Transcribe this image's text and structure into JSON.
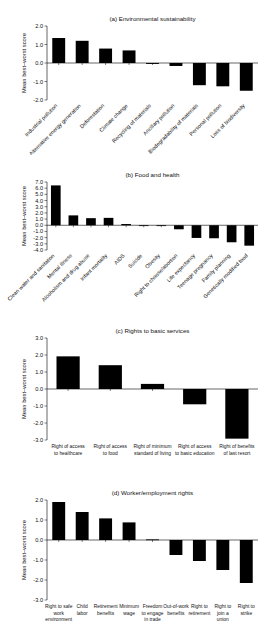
{
  "figure": {
    "ylabel": "Mean best–worst score",
    "panels": [
      {
        "title": "(a) Environmental sustainability",
        "label_style": "rotated",
        "chart": {
          "type": "bar",
          "title": "(a) Environmental sustainability",
          "xlabel": "",
          "ylabel": "Mean best–worst score",
          "ylim": [
            -2.0,
            2.0
          ],
          "yticks": [
            2.0,
            1.0,
            0.0,
            -1.0,
            -2.0
          ],
          "ytick_labels": [
            "2.0",
            "1.0",
            "0.0",
            "-1.0",
            "-2.0"
          ],
          "grid": false,
          "legend": "none",
          "categories": [
            "Industrial pollution",
            "Alternative energy generation",
            "Deforestation",
            "Climate change",
            "Recycling of materials",
            "Ancillary pollution",
            "Biodegradability of materials",
            "Personal pollution",
            "Loss of biodiversity"
          ],
          "values": [
            1.35,
            1.2,
            0.78,
            0.68,
            -0.05,
            -0.16,
            -1.2,
            -1.26,
            -1.5
          ]
        }
      },
      {
        "title": "(b) Food and health",
        "label_style": "rotated",
        "chart": {
          "type": "bar",
          "title": "(b) Food and health",
          "xlabel": "",
          "ylabel": "Mean best–worst score",
          "ylim": [
            -4.0,
            7.0
          ],
          "yticks": [
            7.0,
            6.0,
            5.0,
            4.0,
            3.0,
            2.0,
            1.0,
            0.0,
            -1.0,
            -2.0,
            -3.0,
            -4.0
          ],
          "ytick_labels": [
            "7.0",
            "6.0",
            "5.0",
            "4.0",
            "3.0",
            "2.0",
            "1.0",
            "0.0",
            "-1.0",
            "-2.0",
            "-3.0",
            "-4.0"
          ],
          "grid": false,
          "legend": "none",
          "categories": [
            "Clean water and sanitation",
            "Mental illness",
            "Alcoholism and drug abuse",
            "Infant mortality",
            "AIDS",
            "Suicide",
            "Obesity",
            "Right to choose/abortion",
            "Life expectancy",
            "Teenage pregnancy",
            "Family planning",
            "Genetically modified food"
          ],
          "values": [
            6.45,
            1.6,
            1.15,
            1.2,
            0.2,
            -0.02,
            -0.05,
            -0.65,
            -2.05,
            -2.1,
            -2.75,
            -3.3
          ]
        }
      },
      {
        "title": "(c) Rights to basic services",
        "label_style": "flat",
        "chart": {
          "type": "bar",
          "title": "(c) Rights to basic services",
          "xlabel": "",
          "ylabel": "Mean best–worst score",
          "ylim": [
            -3.0,
            3.0
          ],
          "yticks": [
            3.0,
            2.0,
            1.0,
            0.0,
            -1.0,
            -2.0,
            -3.0
          ],
          "ytick_labels": [
            "3.0",
            "2.0",
            "1.0",
            "0.0",
            "-1.0",
            "-2.0",
            "-3.0"
          ],
          "grid": false,
          "legend": "none",
          "categories": [
            "Right of access to healthcare",
            "Right of access to food",
            "Right of minimum standard of living",
            "Right of access to basic education",
            "Right of benefits of last resort"
          ],
          "category_lines": [
            [
              "Right of access",
              "to healthcare"
            ],
            [
              "Right of access",
              "to food"
            ],
            [
              "Right of minimum",
              "standard of living"
            ],
            [
              "Right of access",
              "to basic education"
            ],
            [
              "Right of benefits",
              "of last resort"
            ]
          ],
          "values": [
            1.92,
            1.4,
            0.3,
            -0.9,
            -2.92
          ]
        }
      },
      {
        "title": "(d) Worker/employment rights",
        "label_style": "flat",
        "chart": {
          "type": "bar",
          "title": "(d) Worker/employment rights",
          "xlabel": "",
          "ylabel": "Mean best–worst score",
          "ylim": [
            -3.0,
            2.0
          ],
          "yticks": [
            2.0,
            1.0,
            0.0,
            -1.0,
            -2.0,
            -3.0
          ],
          "ytick_labels": [
            "2.0",
            "1.0",
            "0.0",
            "-1.0",
            "-2.0",
            "-3.0"
          ],
          "grid": false,
          "legend": "none",
          "categories": [
            "Right to safe work environment",
            "Child labor",
            "Retirement benefits",
            "Minimum wage",
            "Freedom to engage in trade",
            "Out-of-work benefits",
            "Right to retirement",
            "Right to join a union",
            "Right to strike"
          ],
          "category_lines": [
            [
              "Right to safe",
              "work",
              "environment"
            ],
            [
              "Child",
              "labor"
            ],
            [
              "Retirement",
              "benefits"
            ],
            [
              "Minimum",
              "wage"
            ],
            [
              "Freedom",
              "to engage",
              "in trade"
            ],
            [
              "Out-of-work",
              "benefits"
            ],
            [
              "Right to",
              "retirement"
            ],
            [
              "Right to",
              "join a",
              "union"
            ],
            [
              "Right to",
              "strike"
            ]
          ],
          "values": [
            1.9,
            1.4,
            1.08,
            0.88,
            0.03,
            -0.75,
            -1.05,
            -1.5,
            -2.15
          ]
        }
      }
    ]
  },
  "chart_data": [
    {
      "type": "bar",
      "title": "(a) Environmental sustainability",
      "ylabel": "Mean best–worst score",
      "xlabel": "",
      "ylim": [
        -2.0,
        2.0
      ],
      "categories": [
        "Industrial pollution",
        "Alternative energy generation",
        "Deforestation",
        "Climate change",
        "Recycling of materials",
        "Ancillary pollution",
        "Biodegradability of materials",
        "Personal pollution",
        "Loss of biodiversity"
      ],
      "values": [
        1.35,
        1.2,
        0.78,
        0.68,
        -0.05,
        -0.16,
        -1.2,
        -1.26,
        -1.5
      ]
    },
    {
      "type": "bar",
      "title": "(b) Food and health",
      "ylabel": "Mean best–worst score",
      "xlabel": "",
      "ylim": [
        -4.0,
        7.0
      ],
      "categories": [
        "Clean water and sanitation",
        "Mental illness",
        "Alcoholism and drug abuse",
        "Infant mortality",
        "AIDS",
        "Suicide",
        "Obesity",
        "Right to choose/abortion",
        "Life expectancy",
        "Teenage pregnancy",
        "Family planning",
        "Genetically modified food"
      ],
      "values": [
        6.45,
        1.6,
        1.15,
        1.2,
        0.2,
        -0.02,
        -0.05,
        -0.65,
        -2.05,
        -2.1,
        -2.75,
        -3.3
      ]
    },
    {
      "type": "bar",
      "title": "(c) Rights to basic services",
      "ylabel": "Mean best–worst score",
      "xlabel": "",
      "ylim": [
        -3.0,
        3.0
      ],
      "categories": [
        "Right of access to healthcare",
        "Right of access to food",
        "Right of minimum standard of living",
        "Right of access to basic education",
        "Right of benefits of last resort"
      ],
      "values": [
        1.92,
        1.4,
        0.3,
        -0.9,
        -2.92
      ]
    },
    {
      "type": "bar",
      "title": "(d) Worker/employment rights",
      "ylabel": "Mean best–worst score",
      "xlabel": "",
      "ylim": [
        -3.0,
        2.0
      ],
      "categories": [
        "Right to safe work environment",
        "Child labor",
        "Retirement benefits",
        "Minimum wage",
        "Freedom to engage in trade",
        "Out-of-work benefits",
        "Right to retirement",
        "Right to join a union",
        "Right to strike"
      ],
      "values": [
        1.9,
        1.4,
        1.08,
        0.88,
        0.03,
        -0.75,
        -1.05,
        -1.5,
        -2.15
      ]
    }
  ]
}
